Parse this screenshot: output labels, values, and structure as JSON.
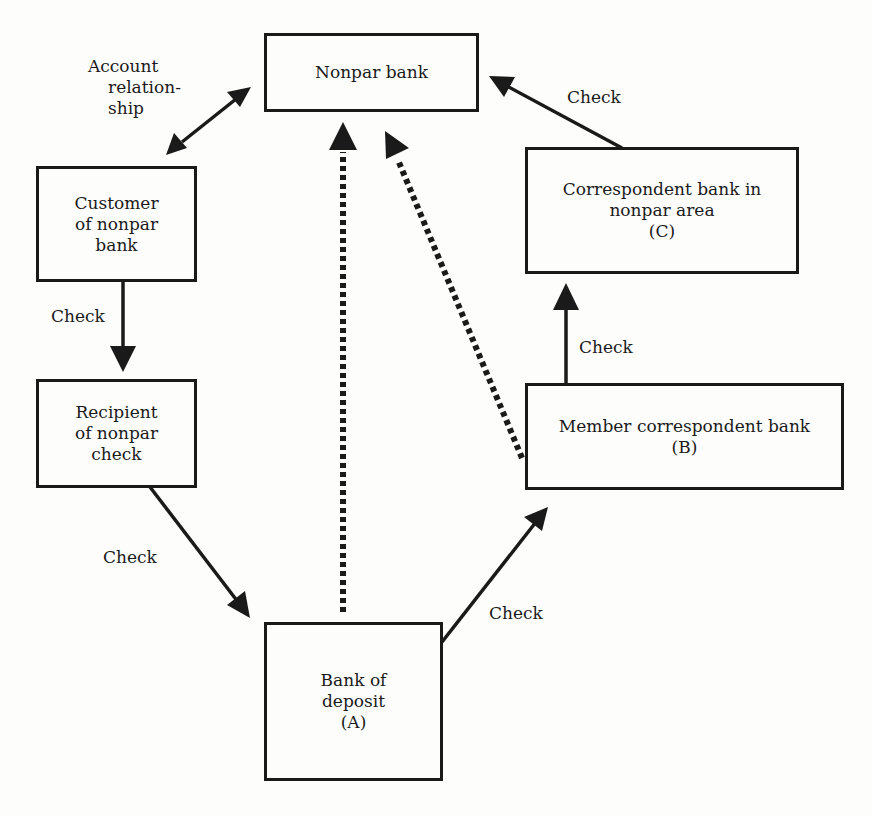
{
  "nodes": {
    "nonpar_bank": {
      "lines": [
        "Nonpar bank"
      ]
    },
    "customer": {
      "lines": [
        "Customer",
        "of nonpar",
        "bank"
      ]
    },
    "recipient": {
      "lines": [
        "Recipient",
        "of nonpar",
        "check"
      ]
    },
    "bank_a": {
      "lines": [
        "Bank of",
        "deposit",
        "(A)"
      ]
    },
    "bank_b": {
      "lines": [
        "Member correspondent bank",
        "(B)"
      ]
    },
    "bank_c": {
      "lines": [
        "Correspondent bank in",
        "nonpar area",
        "(C)"
      ]
    }
  },
  "edge_labels": {
    "account_relationship": [
      "Account",
      "relation-",
      "ship"
    ],
    "customer_to_recipient": "Check",
    "recipient_to_a": "Check",
    "a_to_b": "Check",
    "b_to_c": "Check",
    "c_to_nonpar": "Check"
  },
  "edges": [
    {
      "from": "customer",
      "to": "nonpar_bank",
      "style": "solid",
      "bidirectional": true,
      "label": "Account relationship"
    },
    {
      "from": "customer",
      "to": "recipient",
      "style": "solid",
      "label": "Check"
    },
    {
      "from": "recipient",
      "to": "bank_a",
      "style": "solid",
      "label": "Check"
    },
    {
      "from": "bank_a",
      "to": "bank_b",
      "style": "solid",
      "label": "Check"
    },
    {
      "from": "bank_b",
      "to": "bank_c",
      "style": "solid",
      "label": "Check"
    },
    {
      "from": "bank_c",
      "to": "nonpar_bank",
      "style": "solid",
      "label": "Check"
    },
    {
      "from": "bank_a",
      "to": "nonpar_bank",
      "style": "dotted"
    },
    {
      "from": "bank_b",
      "to": "nonpar_bank",
      "style": "dotted"
    }
  ],
  "colors": {
    "ink": "#1a1a1a",
    "paper": "#fdfdfc"
  }
}
